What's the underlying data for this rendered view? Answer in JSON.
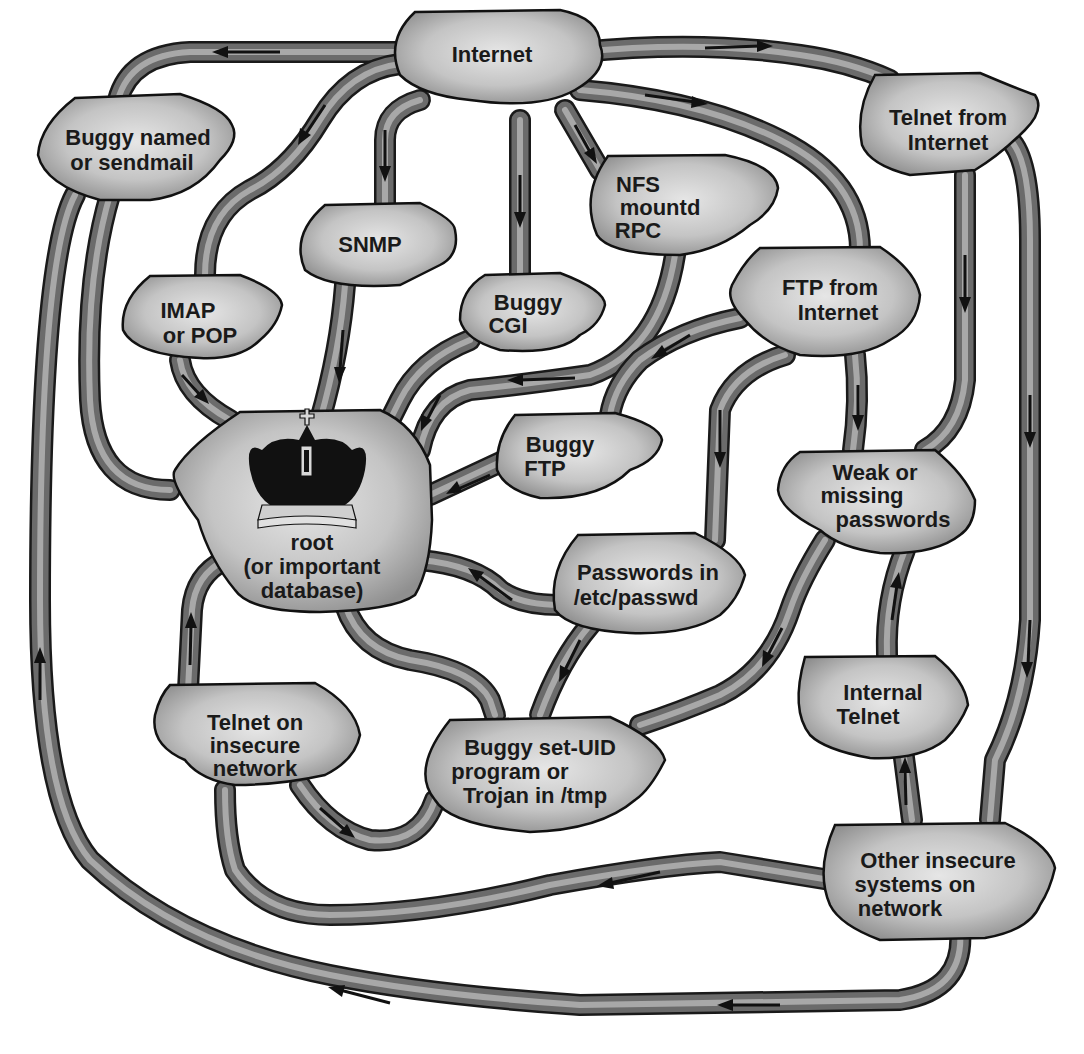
{
  "diagram": {
    "type": "attack-path network diagram",
    "center_node": "root",
    "nodes": {
      "internet": {
        "lines": [
          "Internet"
        ]
      },
      "buggy_named": {
        "lines": [
          "Buggy named",
          "or sendmail"
        ]
      },
      "telnet_internet": {
        "lines": [
          "Telnet from",
          "Internet"
        ]
      },
      "snmp": {
        "lines": [
          "SNMP"
        ]
      },
      "nfs": {
        "lines": [
          "NFS",
          "mountd",
          "RPC"
        ]
      },
      "imap": {
        "lines": [
          "IMAP",
          "or POP"
        ]
      },
      "buggy_cgi": {
        "lines": [
          "Buggy",
          "CGI"
        ]
      },
      "ftp_internet": {
        "lines": [
          "FTP from",
          "Internet"
        ]
      },
      "buggy_ftp": {
        "lines": [
          "Buggy",
          "FTP"
        ]
      },
      "root": {
        "lines": [
          "root",
          "(or important",
          "database)"
        ],
        "icon": "crown-icon"
      },
      "weak_passwords": {
        "lines": [
          "Weak or",
          "missing",
          "passwords"
        ]
      },
      "passwords_etc": {
        "lines": [
          "Passwords in",
          "/etc/passwd"
        ]
      },
      "telnet_insecure": {
        "lines": [
          "Telnet on",
          "insecure",
          "network"
        ]
      },
      "buggy_setuid": {
        "lines": [
          "Buggy set-UID",
          "program or",
          "Trojan in /tmp"
        ]
      },
      "internal_telnet": {
        "lines": [
          "Internal",
          "Telnet"
        ]
      },
      "other_insecure": {
        "lines": [
          "Other insecure",
          "systems on",
          "network"
        ]
      }
    },
    "edges": [
      {
        "from": "Internet",
        "to": "Buggy named or sendmail"
      },
      {
        "from": "Internet",
        "to": "Telnet from Internet"
      },
      {
        "from": "Internet",
        "to": "IMAP or POP"
      },
      {
        "from": "Internet",
        "to": "SNMP"
      },
      {
        "from": "Internet",
        "to": "Buggy CGI"
      },
      {
        "from": "Internet",
        "to": "NFS mountd RPC"
      },
      {
        "from": "Internet",
        "to": "FTP from Internet"
      },
      {
        "from": "Buggy named or sendmail",
        "to": "root"
      },
      {
        "from": "IMAP or POP",
        "to": "root"
      },
      {
        "from": "SNMP",
        "to": "root"
      },
      {
        "from": "Buggy CGI",
        "to": "root"
      },
      {
        "from": "NFS mountd RPC",
        "to": "root"
      },
      {
        "from": "FTP from Internet",
        "to": "Buggy FTP"
      },
      {
        "from": "FTP from Internet",
        "to": "Passwords in /etc/passwd"
      },
      {
        "from": "FTP from Internet",
        "to": "Weak or missing passwords"
      },
      {
        "from": "Buggy FTP",
        "to": "root"
      },
      {
        "from": "Telnet from Internet",
        "to": "Weak or missing passwords"
      },
      {
        "from": "Telnet from Internet",
        "to": "Other insecure systems on network"
      },
      {
        "from": "Passwords in /etc/passwd",
        "to": "root"
      },
      {
        "from": "Passwords in /etc/passwd",
        "to": "Buggy set-UID program or Trojan in /tmp"
      },
      {
        "from": "Weak or missing passwords",
        "to": "Buggy set-UID program or Trojan in /tmp"
      },
      {
        "from": "Internal Telnet",
        "to": "Weak or missing passwords"
      },
      {
        "from": "Other insecure systems on network",
        "to": "Internal Telnet"
      },
      {
        "from": "Other insecure systems on network",
        "to": "Telnet on insecure network"
      },
      {
        "from": "Other insecure systems on network",
        "to": "Buggy named or sendmail"
      },
      {
        "from": "Telnet on insecure network",
        "to": "root"
      },
      {
        "from": "Telnet on insecure network",
        "to": "Buggy set-UID program or Trojan in /tmp"
      },
      {
        "from": "Buggy set-UID program or Trojan in /tmp",
        "to": "root"
      }
    ],
    "colors": {
      "pipe_dark": "#1a1a1a",
      "pipe_mid": "#6b6b6b",
      "pipe_light": "#a8a8a8",
      "node_fill_light": "#e6e6e6",
      "node_fill_dark": "#9a9a9a",
      "crown": "#111111",
      "background": "#ffffff"
    }
  }
}
